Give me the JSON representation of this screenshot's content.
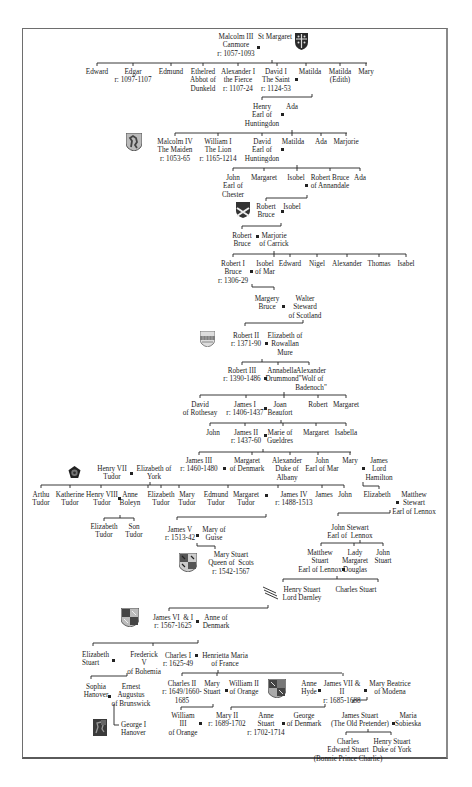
{
  "diagram": {
    "type": "family-tree",
    "marriage_marker": "■",
    "people": [
      {
        "id": "malcolm3",
        "text": "Malcolm III\nCanmore\nr: 1057-1093"
      },
      {
        "id": "stmargaret",
        "text": "St Margaret"
      },
      {
        "id": "edward",
        "text": "Edward"
      },
      {
        "id": "edgar",
        "text": "Edgar\nr: 1097-1107"
      },
      {
        "id": "edmund",
        "text": "Edmund"
      },
      {
        "id": "ethelred",
        "text": "Ethelred\nAbbot of\nDunkeld"
      },
      {
        "id": "alexander1",
        "text": "Alexander I\nthe Fierce\nr: 1107-24"
      },
      {
        "id": "david1",
        "text": "David I\nThe Saint\nr: 1124-53"
      },
      {
        "id": "matilda1",
        "text": "Matilda"
      },
      {
        "id": "matilda_edith",
        "text": "Matilda\n(Edith)"
      },
      {
        "id": "mary1",
        "text": "Mary"
      },
      {
        "id": "henry_hunt",
        "text": "Henry\nEarl of\nHuntingdon"
      },
      {
        "id": "ada1",
        "text": "Ada"
      },
      {
        "id": "malcolm4",
        "text": "Malcolm IV\nThe Maiden\nr: 1053-65"
      },
      {
        "id": "william1",
        "text": "William I\nThe Lion\nr: 1165-1214"
      },
      {
        "id": "david_hunt",
        "text": "David\nEarl of\nHuntingdon"
      },
      {
        "id": "matilda2",
        "text": "Matilda"
      },
      {
        "id": "ada2",
        "text": "Ada"
      },
      {
        "id": "marjorie1",
        "text": "Marjorie"
      },
      {
        "id": "john_chester",
        "text": "John\nEarl of\nChester"
      },
      {
        "id": "margaret1",
        "text": "Margaret"
      },
      {
        "id": "isobel1",
        "text": "Isobel"
      },
      {
        "id": "rbruce_annandale",
        "text": "Robert Bruce\nof Annandale"
      },
      {
        "id": "ada3",
        "text": "Ada"
      },
      {
        "id": "rbruce2",
        "text": "Robert\nBruce"
      },
      {
        "id": "isobel2",
        "text": "Isobel"
      },
      {
        "id": "rbruce3",
        "text": "Robert\nBruce"
      },
      {
        "id": "marjorie_carrick",
        "text": "Marjorie\nof Carrick"
      },
      {
        "id": "robert1",
        "text": "Robert I\nBruce\nr: 1306-29"
      },
      {
        "id": "isobel_mar",
        "text": "Isobel\nof Mar"
      },
      {
        "id": "edward2",
        "text": "Edward"
      },
      {
        "id": "nigel",
        "text": "Nigel"
      },
      {
        "id": "alexander2",
        "text": "Alexander"
      },
      {
        "id": "thomas",
        "text": "Thomas"
      },
      {
        "id": "isabel1",
        "text": "Isabel"
      },
      {
        "id": "margery",
        "text": "Margery\nBruce"
      },
      {
        "id": "walter",
        "text": "Walter\nSteward\nof Scotland"
      },
      {
        "id": "robert2",
        "text": "Robert II\nr: 1371-90"
      },
      {
        "id": "eliz_mure",
        "text": "Elizabeth of\nRowallan\nMure"
      },
      {
        "id": "robert3",
        "text": "Robert III\nr: 1390-1486"
      },
      {
        "id": "annabella",
        "text": "Annabella\nDrummond"
      },
      {
        "id": "alex_wolf",
        "text": "Alexander\n\"Wolf of\nBadenoch\""
      },
      {
        "id": "david_rothesay",
        "text": "David\nof Rothesay"
      },
      {
        "id": "james1",
        "text": "James I\nr: 1406-1437"
      },
      {
        "id": "joan",
        "text": "Joan\nBeaufort"
      },
      {
        "id": "robert4",
        "text": "Robert"
      },
      {
        "id": "margaret2",
        "text": "Margaret"
      },
      {
        "id": "john1",
        "text": "John"
      },
      {
        "id": "james2",
        "text": "James II\nr: 1437-60"
      },
      {
        "id": "marie_gueldres",
        "text": "Marie of\nGueldres"
      },
      {
        "id": "margaret3",
        "text": "Margaret"
      },
      {
        "id": "isabella",
        "text": "Isabella"
      },
      {
        "id": "james3",
        "text": "James III\nr: 1460-1480"
      },
      {
        "id": "margaret_denmark",
        "text": "Margaret\nof Denmark"
      },
      {
        "id": "alex_albany",
        "text": "Alexander\nDuke of\nAlbany"
      },
      {
        "id": "john_mar",
        "text": "John\nEarl of Mar"
      },
      {
        "id": "mary2",
        "text": "Mary"
      },
      {
        "id": "james_hamilton",
        "text": "James\nLord\nHamilton"
      },
      {
        "id": "henry7",
        "text": "Henry VII\nTudor"
      },
      {
        "id": "eliz_york",
        "text": "Elizabeth of\nYork"
      },
      {
        "id": "arthur",
        "text": "Arthu\nTudor"
      },
      {
        "id": "katherine",
        "text": "Katherine\nTudor"
      },
      {
        "id": "henry8",
        "text": "Henry VIII\nTudor"
      },
      {
        "id": "anne_boleyn",
        "text": "Anne\nBoleyn"
      },
      {
        "id": "eliz_tudor1",
        "text": "Elizabeth\nTudor"
      },
      {
        "id": "mary_tudor",
        "text": "Mary\nTudor"
      },
      {
        "id": "edmund_tudor",
        "text": "Edmund\nTudor"
      },
      {
        "id": "margaret_tudor",
        "text": "Margaret\nTudor"
      },
      {
        "id": "james4",
        "text": "James IV\nr: 1488-1513"
      },
      {
        "id": "james_b",
        "text": "James"
      },
      {
        "id": "john_b",
        "text": "John"
      },
      {
        "id": "elizabeth_h",
        "text": "Elizabeth"
      },
      {
        "id": "matthew_lennox1",
        "text": "Matthew\nStewart\nEarl of Lennox"
      },
      {
        "id": "eliz_tudor2",
        "text": "Elizabeth\nTudor"
      },
      {
        "id": "son_tudor",
        "text": "Son\nTudor"
      },
      {
        "id": "james5",
        "text": "James V\nr: 1513-42"
      },
      {
        "id": "mary_guise",
        "text": "Mary of\nGuise"
      },
      {
        "id": "john_stewart",
        "text": "John Stewart\nEarl of  Lennox"
      },
      {
        "id": "mary_qos",
        "text": "Mary Stuart\nQueen of  Scots\nr: 1542-1567"
      },
      {
        "id": "matthew_lennox2",
        "text": "Matthew\nStuart\nEarl of Lennox"
      },
      {
        "id": "margaret_douglas",
        "text": "Lady\nMargaret\nDouglas"
      },
      {
        "id": "john_stuart",
        "text": "John\nStuart"
      },
      {
        "id": "darnley",
        "text": "Henry Stuart\nLord Darnley"
      },
      {
        "id": "charles_stuart1",
        "text": "Charles Stuart"
      },
      {
        "id": "james6",
        "text": "James VI  & I\nr: 1567-1625"
      },
      {
        "id": "anne_denmark",
        "text": "Anne of\nDenmark"
      },
      {
        "id": "eliz_stuart",
        "text": "Elizabeth\nStuart"
      },
      {
        "id": "frederick",
        "text": "Frederick\nV\nof Bohemia"
      },
      {
        "id": "charles1",
        "text": "Charles I\nr: 1625-49"
      },
      {
        "id": "henrietta",
        "text": "Henrietta Maria\nof France"
      },
      {
        "id": "sophia",
        "text": "Sophia\nHanover"
      },
      {
        "id": "ernest",
        "text": "Ernest\nAugustus\nof Brunswick"
      },
      {
        "id": "charles2",
        "text": "Charles II\nr: 1649/1660-\n1685"
      },
      {
        "id": "mary_stuart2",
        "text": "Mary\nStuart"
      },
      {
        "id": "william2",
        "text": "William II\nof Orange"
      },
      {
        "id": "anne_hyde",
        "text": "Anne\nHyde"
      },
      {
        "id": "james7",
        "text": "James VII &\nII\nr: 1685-1688"
      },
      {
        "id": "mary_modena",
        "text": "Mary Beatrice\nof Modena"
      },
      {
        "id": "george1",
        "text": "George I\nHanover"
      },
      {
        "id": "william3",
        "text": "William\nIII\nof Orange"
      },
      {
        "id": "mary2q",
        "text": "Mary II\nr: 1689-1702"
      },
      {
        "id": "anne_q",
        "text": "Anne\nStuart\nr: 1702-1714"
      },
      {
        "id": "george_denmark",
        "text": "George\nof Denmark"
      },
      {
        "id": "old_pretender",
        "text": "James Stuart\n(The Old Pretender)"
      },
      {
        "id": "maria_sobieska",
        "text": "Maria\nSobieska"
      },
      {
        "id": "bonnie",
        "text": "Charles\nEdward Stuart\n(Bonnie Prince Charlie)"
      },
      {
        "id": "henry_york",
        "text": "Henry Stuart\nDuke of York"
      }
    ],
    "coats_of_arms": [
      {
        "name": "st-margaret-arms",
        "colors": [
          "#2a2a2a",
          "#dddddd"
        ]
      },
      {
        "name": "lion-rampant-arms",
        "colors": [
          "#555555",
          "#cccccc"
        ]
      },
      {
        "name": "bruce-saltire-arms",
        "colors": [
          "#333333",
          "#eeeeee"
        ]
      },
      {
        "name": "stewart-checky-arms",
        "colors": [
          "#666666",
          "#bbbbbb"
        ]
      },
      {
        "name": "tudor-rose",
        "colors": [
          "#222222",
          "#888888"
        ]
      },
      {
        "name": "mary-queen-of-scots-arms",
        "colors": [
          "#444444",
          "#cccccc"
        ]
      },
      {
        "name": "james-vi-arms",
        "colors": [
          "#444444",
          "#bbbbbb"
        ]
      },
      {
        "name": "stuart-royal-arms",
        "colors": [
          "#444444",
          "#aaaaaa"
        ]
      },
      {
        "name": "hanover-arms",
        "colors": [
          "#3a3a3a",
          "#888888"
        ]
      }
    ]
  }
}
